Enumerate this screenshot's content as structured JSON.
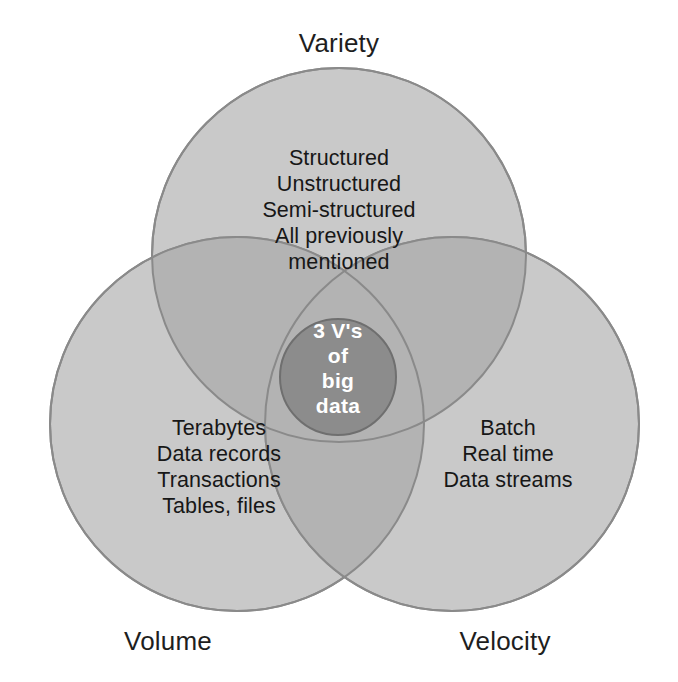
{
  "figure": {
    "cut_header_text": "",
    "title_visible": false
  },
  "diagram": {
    "type": "venn-3-set",
    "background_color": "#ffffff",
    "circle_fill": "#c9c9c9",
    "pair_overlap_fill": "#b3b3b3",
    "center_fill": "#8c8c8c",
    "stroke_color": "#8a8a8a",
    "label_color": "#1e1e1e",
    "center_text_color": "#ffffff",
    "sets": [
      {
        "id": "variety",
        "label": "Variety",
        "label_position": "top",
        "items": [
          "Structured",
          "Unstructured",
          "Semi-structured",
          "All previously",
          "mentioned"
        ]
      },
      {
        "id": "volume",
        "label": "Volume",
        "label_position": "bottom-left",
        "items": [
          "Terabytes",
          "Data records",
          "Transactions",
          "Tables, files"
        ]
      },
      {
        "id": "velocity",
        "label": "Velocity",
        "label_position": "bottom-right",
        "items": [
          "Batch",
          "Real time",
          "Data streams"
        ]
      }
    ],
    "center": {
      "id": "intersection",
      "lines": [
        "3 V's",
        "of",
        "big",
        "data"
      ]
    }
  }
}
